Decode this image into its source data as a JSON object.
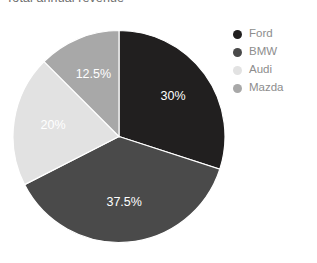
{
  "chart_data": {
    "type": "pie",
    "title": "Total annual revenue",
    "xlabel": "",
    "ylabel": "",
    "grid": false,
    "legend_position": "right",
    "start_angle_deg": 0,
    "direction": "clockwise",
    "categories": [
      "Ford",
      "BMW",
      "Audi",
      "Mazda"
    ],
    "values": [
      30,
      37.5,
      20,
      12.5
    ],
    "value_labels": [
      "30%",
      "37.5%",
      "20%",
      "12.5%"
    ],
    "colors": [
      "#211f1f",
      "#4a4a4a",
      "#e2e2e2",
      "#a8a8a8"
    ],
    "slices": [
      {
        "name": "Ford",
        "value": 30,
        "label": "30%",
        "color": "#211f1f",
        "label_color": "#ffffff"
      },
      {
        "name": "BMW",
        "value": 37.5,
        "label": "37.5%",
        "color": "#4a4a4a",
        "label_color": "#ffffff"
      },
      {
        "name": "Audi",
        "value": 20,
        "label": "20%",
        "color": "#e2e2e2",
        "label_color": "#ffffff"
      },
      {
        "name": "Mazda",
        "value": 12.5,
        "label": "12.5%",
        "color": "#a8a8a8",
        "label_color": "#ffffff"
      }
    ]
  },
  "title": {
    "text": "Total annual revenue"
  },
  "legend": {
    "items": [
      {
        "label": "Ford",
        "color": "#211f1f"
      },
      {
        "label": "BMW",
        "color": "#4a4a4a"
      },
      {
        "label": "Audi",
        "color": "#e2e2e2"
      },
      {
        "label": "Mazda",
        "color": "#a8a8a8"
      }
    ]
  },
  "style": {
    "background": "#ffffff",
    "legend_text_color": "#8d8d8d",
    "title_color": "#6e6e6e"
  }
}
